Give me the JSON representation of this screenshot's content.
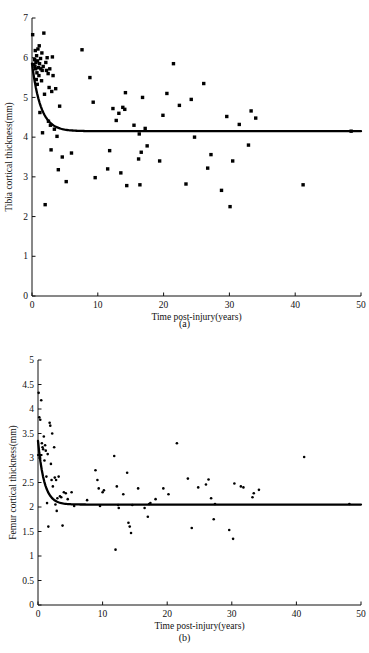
{
  "figure": {
    "panels": [
      {
        "id": "a",
        "caption": "(a)",
        "chart_data": {
          "type": "scatter",
          "title": "",
          "xlabel": "Time post-injury(years)",
          "ylabel": "Tibia cortical thickness(mm)",
          "xlim": [
            0,
            50
          ],
          "ylim": [
            0,
            7
          ],
          "xticks": [
            0,
            10,
            20,
            30,
            40,
            50
          ],
          "yticks": [
            0,
            1,
            2,
            3,
            4,
            5,
            6,
            7
          ],
          "grid": false,
          "legend": "none",
          "marker": "filled-square",
          "series": [
            {
              "name": "Tibia cortical thickness observations",
              "points": [
                [
                  0.1,
                  6.58
                ],
                [
                  0.3,
                  5.83
                ],
                [
                  0.4,
                  5.95
                ],
                [
                  0.45,
                  5.78
                ],
                [
                  0.5,
                  6.18
                ],
                [
                  0.55,
                  5.72
                ],
                [
                  0.6,
                  5.88
                ],
                [
                  0.65,
                  5.45
                ],
                [
                  0.7,
                  6.05
                ],
                [
                  0.75,
                  5.62
                ],
                [
                  0.8,
                  5.33
                ],
                [
                  0.85,
                  5.92
                ],
                [
                  0.9,
                  6.22
                ],
                [
                  1.0,
                  5.75
                ],
                [
                  1.05,
                  5.55
                ],
                [
                  1.1,
                  6.3
                ],
                [
                  1.15,
                  5.85
                ],
                [
                  1.2,
                  4.62
                ],
                [
                  1.3,
                  5.98
                ],
                [
                  1.35,
                  5.72
                ],
                [
                  1.45,
                  5.42
                ],
                [
                  1.5,
                  6.12
                ],
                [
                  1.55,
                  5.68
                ],
                [
                  1.6,
                  4.11
                ],
                [
                  1.7,
                  5.78
                ],
                [
                  1.8,
                  6.62
                ],
                [
                  1.9,
                  5.08
                ],
                [
                  2.0,
                  2.3
                ],
                [
                  2.1,
                  5.88
                ],
                [
                  2.2,
                  5.68
                ],
                [
                  2.3,
                  6.0
                ],
                [
                  2.45,
                  5.6
                ],
                [
                  2.5,
                  4.4
                ],
                [
                  2.6,
                  5.25
                ],
                [
                  2.7,
                  5.72
                ],
                [
                  2.8,
                  4.3
                ],
                [
                  2.9,
                  3.68
                ],
                [
                  3.0,
                  5.15
                ],
                [
                  3.1,
                  6.02
                ],
                [
                  3.2,
                  5.55
                ],
                [
                  3.4,
                  4.2
                ],
                [
                  3.6,
                  5.22
                ],
                [
                  3.8,
                  4.02
                ],
                [
                  4.0,
                  3.18
                ],
                [
                  4.2,
                  4.78
                ],
                [
                  4.6,
                  3.5
                ],
                [
                  5.2,
                  2.88
                ],
                [
                  6.0,
                  3.6
                ],
                [
                  7.6,
                  6.2
                ],
                [
                  8.8,
                  5.5
                ],
                [
                  9.3,
                  4.88
                ],
                [
                  9.6,
                  2.98
                ],
                [
                  11.5,
                  3.2
                ],
                [
                  11.8,
                  3.66
                ],
                [
                  12.3,
                  4.72
                ],
                [
                  12.8,
                  4.42
                ],
                [
                  13.2,
                  4.6
                ],
                [
                  13.5,
                  3.1
                ],
                [
                  13.8,
                  4.75
                ],
                [
                  14.1,
                  4.7
                ],
                [
                  14.2,
                  5.12
                ],
                [
                  14.4,
                  2.78
                ],
                [
                  15.5,
                  4.3
                ],
                [
                  16.2,
                  3.45
                ],
                [
                  16.3,
                  4.08
                ],
                [
                  16.4,
                  2.8
                ],
                [
                  16.6,
                  3.62
                ],
                [
                  16.8,
                  5.0
                ],
                [
                  17.2,
                  4.22
                ],
                [
                  17.5,
                  3.78
                ],
                [
                  19.4,
                  3.4
                ],
                [
                  19.9,
                  4.55
                ],
                [
                  20.5,
                  5.1
                ],
                [
                  21.5,
                  5.85
                ],
                [
                  22.4,
                  4.8
                ],
                [
                  23.4,
                  2.82
                ],
                [
                  24.2,
                  4.95
                ],
                [
                  24.7,
                  4.0
                ],
                [
                  26.1,
                  5.35
                ],
                [
                  26.7,
                  3.22
                ],
                [
                  27.2,
                  3.56
                ],
                [
                  28.8,
                  2.66
                ],
                [
                  29.6,
                  4.52
                ],
                [
                  30.1,
                  2.25
                ],
                [
                  30.5,
                  3.4
                ],
                [
                  31.5,
                  4.32
                ],
                [
                  32.9,
                  3.8
                ],
                [
                  33.3,
                  4.66
                ],
                [
                  34.0,
                  4.48
                ],
                [
                  41.2,
                  2.8
                ],
                [
                  48.5,
                  4.15
                ]
              ]
            }
          ],
          "fit": {
            "name": "Exponential decay fit",
            "y0": 5.85,
            "asymptote": 4.15,
            "decay_rate": 0.75,
            "description": "Exponential decay from 5.85 mm at injury to plateau 4.15 mm"
          }
        }
      },
      {
        "id": "b",
        "caption": "(b)",
        "chart_data": {
          "type": "scatter",
          "title": "",
          "xlabel": "Time post-injury(years)",
          "ylabel": "Femur cortical thickness(mm)",
          "xlim": [
            0,
            50
          ],
          "ylim": [
            0,
            5
          ],
          "xticks": [
            0,
            10,
            20,
            30,
            40,
            50
          ],
          "yticks": [
            0,
            0.5,
            1,
            1.5,
            2,
            2.5,
            3,
            3.5,
            4,
            4.5,
            5
          ],
          "grid": false,
          "legend": "none",
          "marker": "filled-circle",
          "series": [
            {
              "name": "Femur cortical thickness observations",
              "points": [
                [
                  0.1,
                  4.33
                ],
                [
                  0.2,
                  3.83
                ],
                [
                  0.35,
                  3.78
                ],
                [
                  0.5,
                  4.18
                ],
                [
                  0.6,
                  3.3
                ],
                [
                  0.7,
                  3.22
                ],
                [
                  0.8,
                  3.18
                ],
                [
                  0.9,
                  3.44
                ],
                [
                  1.0,
                  2.95
                ],
                [
                  1.1,
                  3.26
                ],
                [
                  1.2,
                  3.15
                ],
                [
                  1.3,
                  2.62
                ],
                [
                  1.4,
                  2.08
                ],
                [
                  1.5,
                  3.08
                ],
                [
                  1.6,
                  1.6
                ],
                [
                  1.8,
                  3.72
                ],
                [
                  1.9,
                  3.66
                ],
                [
                  2.0,
                  2.88
                ],
                [
                  2.1,
                  2.55
                ],
                [
                  2.2,
                  3.5
                ],
                [
                  2.3,
                  2.42
                ],
                [
                  2.5,
                  3.22
                ],
                [
                  2.6,
                  2.6
                ],
                [
                  2.7,
                  2.05
                ],
                [
                  2.8,
                  2.55
                ],
                [
                  2.9,
                  1.92
                ],
                [
                  3.0,
                  2.18
                ],
                [
                  3.2,
                  2.62
                ],
                [
                  3.4,
                  2.22
                ],
                [
                  3.6,
                  2.2
                ],
                [
                  3.8,
                  1.62
                ],
                [
                  4.0,
                  2.3
                ],
                [
                  4.3,
                  2.28
                ],
                [
                  4.6,
                  2.16
                ],
                [
                  5.2,
                  2.3
                ],
                [
                  5.6,
                  2.02
                ],
                [
                  7.6,
                  2.14
                ],
                [
                  8.9,
                  2.75
                ],
                [
                  9.2,
                  2.55
                ],
                [
                  9.4,
                  2.38
                ],
                [
                  9.6,
                  2.02
                ],
                [
                  10.0,
                  2.3
                ],
                [
                  10.2,
                  2.34
                ],
                [
                  11.8,
                  3.04
                ],
                [
                  12.0,
                  1.13
                ],
                [
                  12.2,
                  2.42
                ],
                [
                  12.4,
                  2.04
                ],
                [
                  12.5,
                  1.98
                ],
                [
                  13.2,
                  2.26
                ],
                [
                  13.8,
                  2.7
                ],
                [
                  14.0,
                  1.68
                ],
                [
                  14.2,
                  1.6
                ],
                [
                  14.4,
                  1.47
                ],
                [
                  14.6,
                  2.04
                ],
                [
                  15.5,
                  2.38
                ],
                [
                  16.5,
                  1.98
                ],
                [
                  17.0,
                  1.8
                ],
                [
                  17.2,
                  2.06
                ],
                [
                  17.4,
                  2.08
                ],
                [
                  18.2,
                  2.16
                ],
                [
                  19.4,
                  2.38
                ],
                [
                  20.2,
                  2.26
                ],
                [
                  21.5,
                  3.3
                ],
                [
                  23.2,
                  2.58
                ],
                [
                  23.8,
                  1.57
                ],
                [
                  24.8,
                  2.4
                ],
                [
                  26.0,
                  2.46
                ],
                [
                  26.4,
                  2.56
                ],
                [
                  26.8,
                  2.18
                ],
                [
                  27.2,
                  1.75
                ],
                [
                  27.4,
                  2.06
                ],
                [
                  29.6,
                  1.53
                ],
                [
                  30.2,
                  1.35
                ],
                [
                  30.4,
                  2.48
                ],
                [
                  31.4,
                  2.42
                ],
                [
                  31.8,
                  2.4
                ],
                [
                  33.2,
                  2.2
                ],
                [
                  33.4,
                  2.28
                ],
                [
                  34.2,
                  2.35
                ],
                [
                  41.2,
                  3.02
                ],
                [
                  48.2,
                  2.06
                ]
              ]
            }
          ],
          "fit": {
            "name": "Exponential decay fit",
            "y0": 3.35,
            "asymptote": 2.05,
            "decay_rate": 1.05,
            "description": "Exponential decay from 3.35 mm at injury to plateau 2.05 mm"
          }
        }
      }
    ]
  },
  "colors": {
    "ink": "#111111",
    "marker": "#000000",
    "fit": "#000000",
    "background": "#ffffff"
  }
}
